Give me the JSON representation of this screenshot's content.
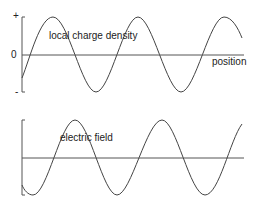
{
  "top_panel": {
    "title": "local charge density",
    "plus_label": "+",
    "zero_label": "0",
    "minus_label": "-",
    "x_axis_label": "position"
  },
  "bottom_panel": {
    "title": "electric field"
  },
  "colors": {
    "line": "#444444",
    "text": "#222222",
    "background": "#ffffff"
  }
}
